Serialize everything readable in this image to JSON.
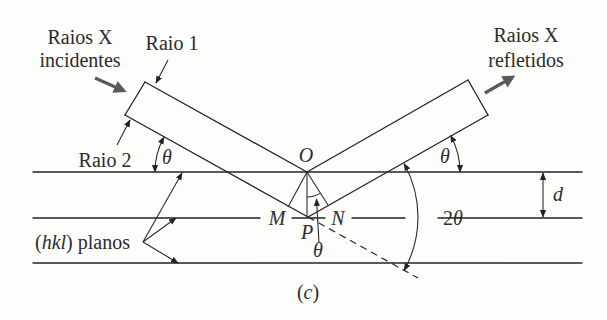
{
  "figure": {
    "incident_label": [
      "Raios X",
      "incidentes"
    ],
    "reflected_label": [
      "Raios X",
      "refletidos"
    ],
    "ray1_label": "Raio 1",
    "ray2_label": "Raio 2",
    "theta": "θ",
    "two_theta": {
      "two": "2",
      "theta": "θ"
    },
    "points": {
      "O": "O",
      "M": "M",
      "N": "N",
      "P": "P"
    },
    "spacing_label": "d",
    "planes_label": {
      "open": "(",
      "hkl": "hkl",
      "rest": ") planos"
    },
    "caption": {
      "open": "(",
      "letter": "c",
      "close": ")"
    }
  },
  "colors": {
    "background": "#fdfdfc",
    "lines": "#232323",
    "beam_arrows": "#5a5a5a",
    "text": "#2b2b2b"
  }
}
